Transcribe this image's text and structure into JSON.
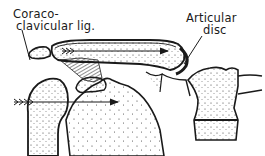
{
  "figure": {
    "type": "anatomical-illustration",
    "labels": {
      "coracoclavicular_line1": "Coraco-",
      "coracoclavicular_line2": "clavicular lig.",
      "articular_disc_line1": "Articular",
      "articular_disc_line2": "disc"
    },
    "arrows": [
      {
        "name": "clavicle-force-arrow",
        "direction": "right",
        "location": "along clavicle"
      },
      {
        "name": "humerus-force-arrow",
        "direction": "right",
        "location": "through humeral head to scapula"
      }
    ],
    "colors": {
      "ink": "#1a1a1a",
      "background": "#ffffff",
      "stipple": "#333333"
    }
  }
}
